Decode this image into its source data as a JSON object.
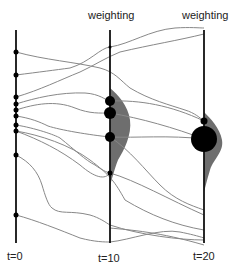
{
  "diagram": {
    "top_labels": [
      {
        "text": "weighting",
        "x": 109
      },
      {
        "text": "weighting",
        "x": 204
      }
    ],
    "time_labels": [
      {
        "text": "t=0",
        "x": 16
      },
      {
        "text": "t=10",
        "x": 110
      },
      {
        "text": "t=20",
        "x": 204
      }
    ],
    "axes_x": [
      16,
      110,
      204
    ],
    "colors": {
      "axis": "#111111",
      "trajectory": "#888888",
      "weight_fill": "#6e6e6e",
      "particle": "#000000"
    },
    "particles_t0": [
      52,
      75,
      97,
      104,
      110,
      116,
      125,
      131,
      155,
      215
    ],
    "particles_t10": [
      {
        "y": 101,
        "r": 5
      },
      {
        "y": 113,
        "r": 6
      },
      {
        "y": 137,
        "r": 5
      },
      {
        "y": 173,
        "r": 2.5
      }
    ],
    "particles_t20": [
      {
        "y": 121,
        "r": 3.5
      },
      {
        "y": 139,
        "r": 13
      }
    ]
  }
}
